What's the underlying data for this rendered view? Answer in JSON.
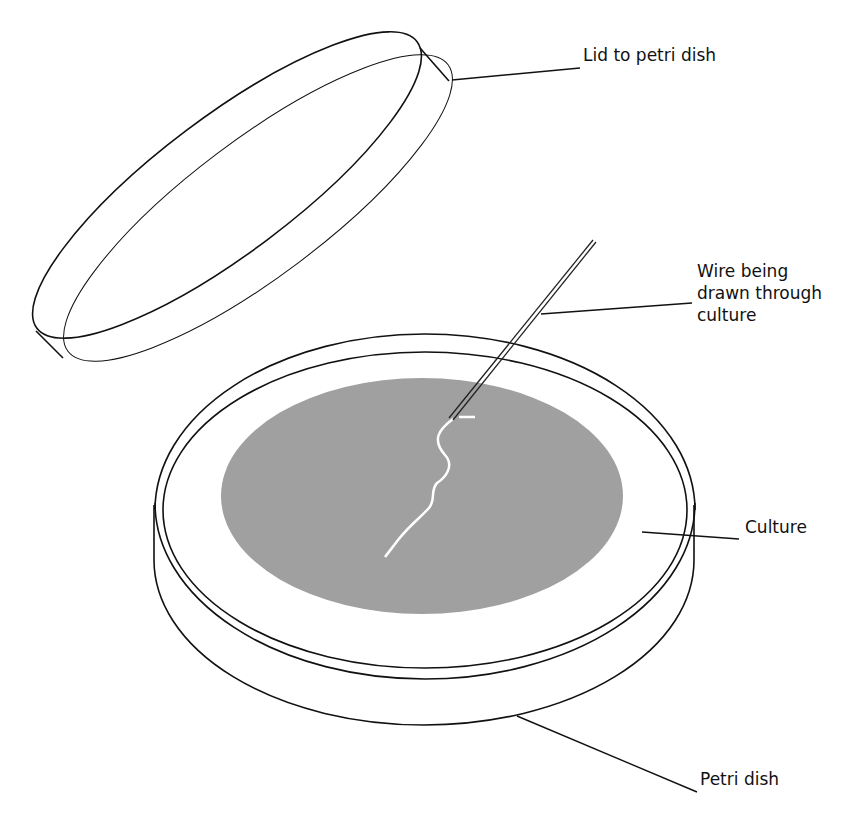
{
  "diagram": {
    "labels": {
      "lid": "Lid to petri dish",
      "wire": "Wire being\ndrawn through\nculture",
      "culture": "Culture",
      "dish": "Petri dish"
    },
    "colors": {
      "stroke": "#111111",
      "culture_fill": "#a0a0a0",
      "streak": "#ffffff",
      "background": "#ffffff"
    }
  }
}
